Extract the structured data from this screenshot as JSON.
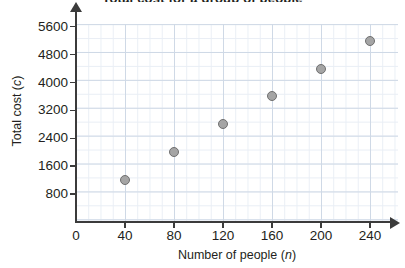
{
  "chart_data": {
    "type": "scatter",
    "title": "Total cost for a group of people",
    "xlabel_text": "Number of people (",
    "xlabel_var": "n",
    "xlabel_close": ")",
    "ylabel_text": "Total cost (",
    "ylabel_var": "c",
    "ylabel_close": ")",
    "x": [
      40,
      80,
      120,
      160,
      200,
      240
    ],
    "values": [
      1200,
      2000,
      2800,
      3600,
      4400,
      5200
    ],
    "points": [
      {
        "n": 40,
        "c": 1200
      },
      {
        "n": 80,
        "c": 2000
      },
      {
        "n": 120,
        "c": 2800
      },
      {
        "n": 160,
        "c": 3600
      },
      {
        "n": 200,
        "c": 4400
      },
      {
        "n": 240,
        "c": 5200
      }
    ],
    "xticks": [
      "0",
      "40",
      "80",
      "120",
      "160",
      "200",
      "240"
    ],
    "xtick_values": [
      0,
      40,
      80,
      120,
      160,
      200,
      240
    ],
    "yticks": [
      "800",
      "1600",
      "2400",
      "3200",
      "4000",
      "4800",
      "5600"
    ],
    "ytick_values": [
      800,
      1600,
      2400,
      3200,
      4000,
      4800,
      5600
    ],
    "xlim": [
      0,
      260
    ],
    "ylim": [
      0,
      6000
    ],
    "xstep": 40,
    "ystep": 800,
    "minor_divisions": 4,
    "grid": true,
    "legend": false,
    "marker_fill": "#a5a5a5",
    "marker_edge": "#6f6f6f",
    "grid_minor_color": "#e9eef5",
    "grid_major_color": "#cfd9e6",
    "axis_color": "#3b3b3b"
  }
}
